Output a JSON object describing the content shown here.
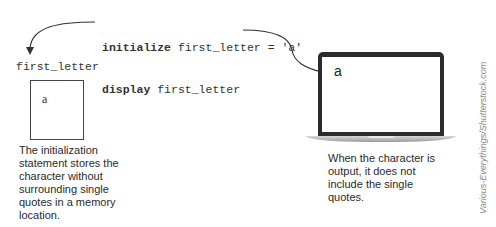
{
  "code": {
    "line1_keyword": "initialize",
    "line1_rest": " first_letter = 'a'",
    "line2_keyword": "display",
    "line2_rest": " first_letter"
  },
  "memory": {
    "variable_name": "first_letter",
    "stored_value": "a"
  },
  "screen": {
    "output_char": "a"
  },
  "captions": {
    "left": [
      "The initialization",
      "statement stores the",
      "character without",
      "surrounding single",
      "quotes in a memory",
      "location."
    ],
    "right": [
      "When the character is",
      "output, it does not",
      "include the single",
      "quotes."
    ]
  },
  "credit": "Various-Everythings/Shutterstock.com",
  "colors": {
    "line": "#333333",
    "bezel": "#2b2b2b",
    "text": "#2a2a2a"
  }
}
